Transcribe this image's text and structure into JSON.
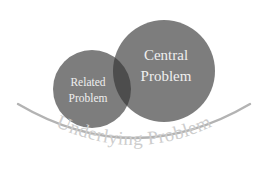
{
  "diagram": {
    "background_color": "#ffffff",
    "width": 267,
    "height": 194,
    "circles": [
      {
        "id": "related",
        "label_line1": "Related",
        "label_line2": "Problem",
        "fill_color": "#7d7d7d",
        "text_color": "#efefef",
        "cx": 92,
        "cy": 89,
        "r": 39
      },
      {
        "id": "central",
        "label_line1": "Central",
        "label_line2": "Problem",
        "fill_color": "#7d7d7d",
        "text_color": "#f2f2f2",
        "cx": 164,
        "cy": 71,
        "r": 51
      }
    ],
    "overlap": {
      "id": "overlap-lens",
      "fill_color": "#4d4d4d"
    },
    "arc": {
      "id": "underlying-arc",
      "stroke_color": "#b3b3b3",
      "stroke_width": 2.4
    },
    "arc_label": {
      "text": "Underlying Problem",
      "color": "#cdcdcd"
    }
  }
}
